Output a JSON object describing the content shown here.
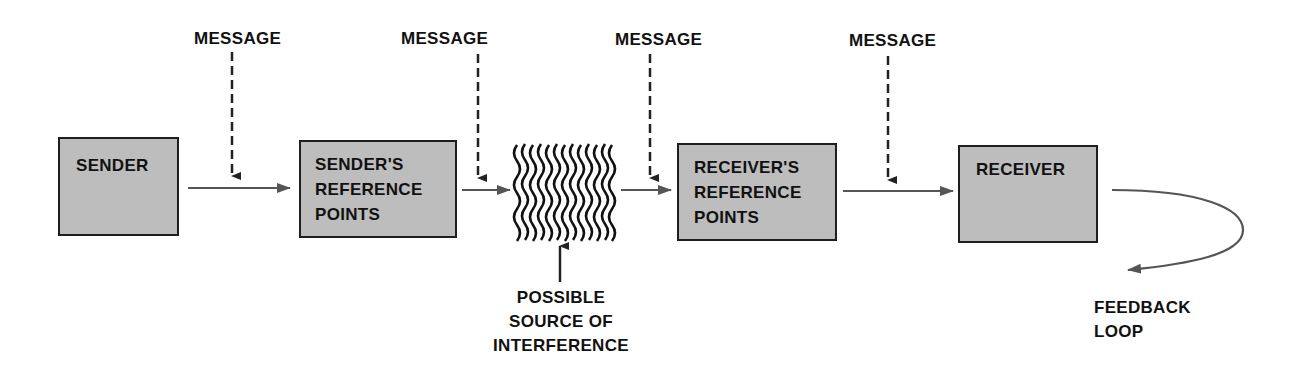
{
  "diagram": {
    "type": "communication-process-flow",
    "nodes": [
      {
        "id": "sender",
        "label": "SENDER"
      },
      {
        "id": "senders-reference-points",
        "label": "SENDER'S\nREFERENCE\nPOINTS"
      },
      {
        "id": "interference",
        "label": "POSSIBLE\nSOURCE OF\nINTERFERENCE"
      },
      {
        "id": "receivers-reference-points",
        "label": "RECEIVER'S\nREFERENCE\nPOINTS"
      },
      {
        "id": "receiver",
        "label": "RECEIVER"
      }
    ],
    "messages": [
      {
        "label": "MESSAGE"
      },
      {
        "label": "MESSAGE"
      },
      {
        "label": "MESSAGE"
      },
      {
        "label": "MESSAGE"
      }
    ],
    "feedback": {
      "label": "FEEDBACK\nLOOP"
    },
    "edges": [
      {
        "from": "sender",
        "to": "senders-reference-points"
      },
      {
        "from": "senders-reference-points",
        "to": "interference"
      },
      {
        "from": "interference",
        "to": "receivers-reference-points"
      },
      {
        "from": "receivers-reference-points",
        "to": "receiver"
      },
      {
        "from": "receiver",
        "to": "feedback-loop"
      }
    ],
    "colors": {
      "box_fill": "#bdbdbd",
      "box_border": "#1e1e1e",
      "arrow": "#555555",
      "text": "#111111"
    }
  }
}
